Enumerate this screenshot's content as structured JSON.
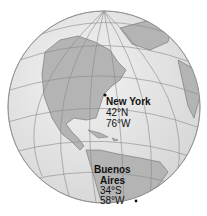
{
  "map": {
    "type": "orthographic-globe",
    "colors": {
      "ocean": "#e6e6e6",
      "land": "#b4b4b4",
      "graticule": "#8a8a8a",
      "coast": "#6e6e6e",
      "text": "#111111"
    }
  },
  "cities": [
    {
      "name": "New York",
      "lat": "42°N",
      "lon": "76°W"
    },
    {
      "name_line1": "Buenos",
      "name_line2": "Aires",
      "lat": "34°S",
      "lon": "58°W"
    }
  ]
}
